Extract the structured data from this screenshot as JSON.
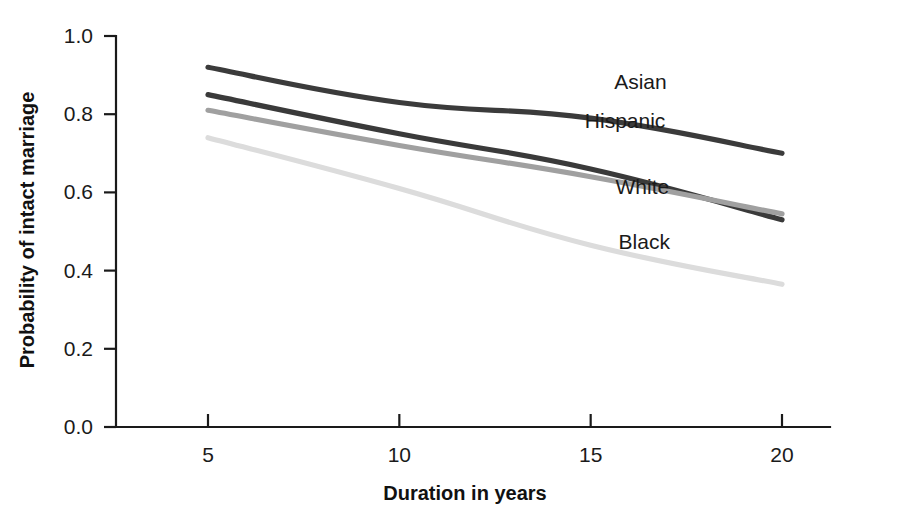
{
  "chart_data": {
    "type": "line",
    "title": "",
    "xlabel": "Duration in years",
    "ylabel": "Probability of intact marriage",
    "x": [
      5,
      10,
      15,
      20
    ],
    "xtick_labels": [
      "5",
      "10",
      "15",
      "20"
    ],
    "ytick_labels": [
      "0.0",
      "0.2",
      "0.4",
      "0.6",
      "0.8",
      "1.0"
    ],
    "ytick_values": [
      0.0,
      0.2,
      0.4,
      0.6,
      0.8,
      1.0
    ],
    "xlim": [
      3.1,
      21.4
    ],
    "ylim": [
      0.0,
      1.0
    ],
    "grid": false,
    "legend_position": "inline-labels",
    "series": [
      {
        "name": "Asian",
        "color": "#3b3b3b",
        "values": [
          0.92,
          0.83,
          0.79,
          0.7
        ],
        "label_x": 16.3,
        "label_y": 0.865
      },
      {
        "name": "Hispanic",
        "color": "#3a3a3a",
        "values": [
          0.85,
          0.75,
          0.66,
          0.53
        ],
        "label_x": 15.9,
        "label_y": 0.765
      },
      {
        "name": "White",
        "color": "#a0a0a0",
        "values": [
          0.81,
          0.72,
          0.64,
          0.545
        ],
        "label_x": 16.35,
        "label_y": 0.595
      },
      {
        "name": "Black",
        "color": "#dcdcdc",
        "values": [
          0.74,
          0.61,
          0.465,
          0.365
        ],
        "label_x": 16.4,
        "label_y": 0.455
      }
    ]
  },
  "axes": {
    "x_axis_name": "Duration in years",
    "y_axis_name": "Probability of intact marriage"
  }
}
